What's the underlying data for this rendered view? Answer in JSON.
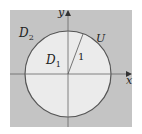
{
  "diagram": {
    "title": "",
    "colors": {
      "outer_region": "#c4c4c4",
      "inner_region": "#ebebeb",
      "circle_stroke": "#555555",
      "axis_stroke": "#666666",
      "text": "#222222",
      "background": "#ffffff"
    },
    "labels": {
      "outer_region": "D",
      "outer_region_sub": "2",
      "inner_region": "D",
      "inner_region_sub": "1",
      "circle": "U",
      "radius": "1",
      "x_axis": "x",
      "y_axis": "y"
    },
    "geometry": {
      "square": {
        "x": 10,
        "y": 10,
        "width": 122,
        "height": 117
      },
      "origin": {
        "x": 68,
        "y": 74
      },
      "circle_radius_px": 43,
      "radius_value": 1,
      "radius_endpoint": {
        "x": 83,
        "y": 34
      }
    }
  }
}
